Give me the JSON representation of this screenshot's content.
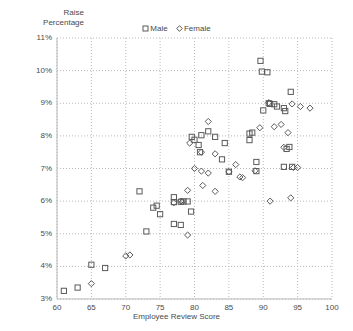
{
  "chart_data": {
    "type": "scatter",
    "title": "",
    "ylabel": "Raise Percentage",
    "ylabel_lines": [
      "Raise",
      "Percentage"
    ],
    "xlabel": "Employee Review Score",
    "xlim": [
      60,
      100
    ],
    "ylim": [
      3,
      11
    ],
    "xticks": [
      60,
      65,
      70,
      75,
      80,
      85,
      90,
      95,
      100
    ],
    "xtick_labels": [
      "60",
      "65",
      "70",
      "75",
      "80",
      "85",
      "90",
      "95",
      "100"
    ],
    "yticks": [
      3,
      4,
      5,
      6,
      7,
      8,
      9,
      10,
      11
    ],
    "ytick_labels": [
      "3%",
      "4%",
      "5%",
      "6%",
      "7%",
      "8%",
      "9%",
      "10%",
      "11%"
    ],
    "grid": true,
    "grid_style": "dotted",
    "legend_position": "top-center",
    "marker_color": "#5a5a5a",
    "grid_color": "#b9b9b9",
    "series": [
      {
        "name": "Male",
        "marker": "square",
        "points": [
          [
            61,
            3.25
          ],
          [
            63,
            3.35
          ],
          [
            65,
            4.05
          ],
          [
            67,
            3.95
          ],
          [
            72,
            6.3
          ],
          [
            73,
            5.07
          ],
          [
            74,
            5.8
          ],
          [
            74.5,
            5.86
          ],
          [
            75,
            5.6
          ],
          [
            77,
            6.12
          ],
          [
            77,
            5.97
          ],
          [
            77,
            5.3
          ],
          [
            78,
            5.27
          ],
          [
            78,
            5.98
          ],
          [
            78.4,
            5.99
          ],
          [
            79,
            5.99
          ],
          [
            79.5,
            5.68
          ],
          [
            79.6,
            7.97
          ],
          [
            80,
            7.88
          ],
          [
            80.6,
            7.72
          ],
          [
            80.8,
            7.5
          ],
          [
            81,
            8.02
          ],
          [
            82,
            8.14
          ],
          [
            83,
            7.97
          ],
          [
            84,
            7.28
          ],
          [
            84.4,
            7.78
          ],
          [
            85,
            6.9
          ],
          [
            88,
            8.07
          ],
          [
            88,
            7.87
          ],
          [
            88.4,
            8.1
          ],
          [
            89,
            7.2
          ],
          [
            89,
            6.92
          ],
          [
            89.6,
            10.3
          ],
          [
            89.8,
            9.97
          ],
          [
            90,
            8.78
          ],
          [
            90.6,
            9.95
          ],
          [
            90.8,
            9.0
          ],
          [
            91,
            8.98
          ],
          [
            91.6,
            8.97
          ],
          [
            92,
            8.9
          ],
          [
            93,
            8.85
          ],
          [
            93.2,
            8.76
          ],
          [
            93.4,
            7.6
          ],
          [
            93.8,
            7.66
          ],
          [
            93,
            7.05
          ],
          [
            94,
            9.35
          ],
          [
            94.2,
            7.05
          ]
        ]
      },
      {
        "name": "Female",
        "marker": "diamond",
        "points": [
          [
            65,
            3.47
          ],
          [
            70,
            4.32
          ],
          [
            70.6,
            4.35
          ],
          [
            77,
            5.95
          ],
          [
            78,
            6.0
          ],
          [
            78.2,
            5.98
          ],
          [
            79,
            6.33
          ],
          [
            79,
            4.96
          ],
          [
            79.3,
            7.78
          ],
          [
            80,
            7.0
          ],
          [
            81,
            7.5
          ],
          [
            81,
            6.92
          ],
          [
            81.2,
            6.48
          ],
          [
            82,
            6.86
          ],
          [
            82,
            8.44
          ],
          [
            83,
            7.45
          ],
          [
            83,
            6.3
          ],
          [
            85,
            6.9
          ],
          [
            86,
            7.12
          ],
          [
            86.6,
            6.74
          ],
          [
            87,
            6.72
          ],
          [
            88.8,
            6.93
          ],
          [
            89.5,
            8.25
          ],
          [
            90.8,
            9.02
          ],
          [
            91,
            6.0
          ],
          [
            91.6,
            8.28
          ],
          [
            92.6,
            8.35
          ],
          [
            93,
            7.65
          ],
          [
            93.6,
            8.1
          ],
          [
            94,
            6.1
          ],
          [
            94.2,
            8.98
          ],
          [
            94.4,
            7.03
          ],
          [
            95,
            7.03
          ],
          [
            95.4,
            8.9
          ],
          [
            96.8,
            8.85
          ]
        ]
      }
    ]
  }
}
